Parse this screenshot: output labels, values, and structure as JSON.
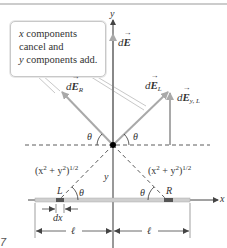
{
  "figure": {
    "number_fragment": "7",
    "callout": {
      "lines": [
        {
          "italic_part": "x",
          "rest": " components"
        },
        {
          "italic_part": "",
          "rest": "cancel and"
        },
        {
          "italic_part": "y",
          "rest": " components add."
        }
      ]
    },
    "axes": {
      "x_label": "x",
      "y_label": "y"
    },
    "vectors": {
      "dE": {
        "prefix": "d",
        "symbol": "E",
        "subscript": ""
      },
      "dE_R": {
        "prefix": "d",
        "symbol": "E",
        "subscript": "R"
      },
      "dE_L": {
        "prefix": "d",
        "symbol": "E",
        "subscript": "L"
      },
      "dE_yL": {
        "prefix": "d",
        "symbol": "E",
        "subscript": "y, L"
      }
    },
    "angles": {
      "theta_upper_left": "θ",
      "theta_upper_right": "θ",
      "theta_lower_left": "θ",
      "theta_lower_right": "θ"
    },
    "distances": {
      "left_hyp_base": "(x",
      "left_hyp_rest": " + y",
      "left_hyp_close": ")",
      "right_hyp_base": "(x",
      "right_hyp_rest": " + y",
      "right_hyp_close": ")",
      "exp2": "2",
      "exp_half": "1/2",
      "y_distance": "y",
      "dx_label": "dx",
      "ell_left": "ℓ",
      "ell_right": "ℓ"
    },
    "points": {
      "L": "L",
      "R": "R"
    },
    "colors": {
      "axis": "#555555",
      "vector": "#a9a9a9",
      "rod": "#c9c9c9",
      "rod_segment": "#555555",
      "dashed": "#333333",
      "origin_dot": "#000000",
      "top_rule": "#999999"
    }
  }
}
